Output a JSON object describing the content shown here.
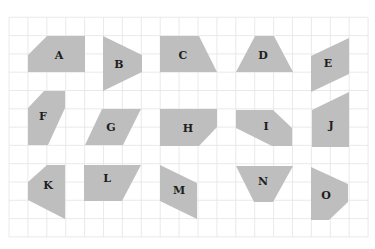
{
  "diagram": {
    "grid": {
      "x0": 9,
      "y0": 17.3,
      "columns": 19,
      "rows": 12,
      "cell_width": 18.9,
      "cell_height": 18.3,
      "line_color": "#e4e4e4"
    },
    "colors": {
      "shape_fill": "#bebebe",
      "label_color": "#1e1e1e",
      "background": "#ffffff"
    },
    "shapes": [
      {
        "label": "A",
        "points": [
          [
            47,
            36
          ],
          [
            85,
            36
          ],
          [
            85,
            72
          ],
          [
            28,
            72
          ],
          [
            28,
            55
          ]
        ],
        "label_pos": [
          59,
          55
        ]
      },
      {
        "label": "B",
        "points": [
          [
            103,
            36
          ],
          [
            142,
            55
          ],
          [
            142,
            72
          ],
          [
            103,
            91
          ]
        ],
        "label_pos": [
          119,
          64
        ]
      },
      {
        "label": "C",
        "points": [
          [
            160,
            36
          ],
          [
            199,
            36
          ],
          [
            217,
            72
          ],
          [
            160,
            72
          ]
        ],
        "label_pos": [
          183,
          55
        ]
      },
      {
        "label": "D",
        "points": [
          [
            255,
            36
          ],
          [
            274,
            36
          ],
          [
            293,
            72
          ],
          [
            236,
            72
          ]
        ],
        "label_pos": [
          263,
          55
        ]
      },
      {
        "label": "E",
        "points": [
          [
            311,
            56
          ],
          [
            349,
            38
          ],
          [
            349,
            74
          ],
          [
            311,
            92
          ]
        ],
        "label_pos": [
          328,
          63
        ]
      },
      {
        "label": "F",
        "points": [
          [
            44,
            91
          ],
          [
            65,
            91
          ],
          [
            65,
            108
          ],
          [
            48,
            145
          ],
          [
            28,
            145
          ],
          [
            28,
            108
          ]
        ],
        "label_pos": [
          43,
          116
        ]
      },
      {
        "label": "G",
        "points": [
          [
            102,
            109
          ],
          [
            141,
            109
          ],
          [
            123,
            145
          ],
          [
            85,
            145
          ]
        ],
        "label_pos": [
          111,
          127
        ]
      },
      {
        "label": "H",
        "points": [
          [
            160,
            109
          ],
          [
            217,
            109
          ],
          [
            217,
            127
          ],
          [
            199,
            146
          ],
          [
            160,
            146
          ]
        ],
        "label_pos": [
          188,
          128
        ]
      },
      {
        "label": "I",
        "points": [
          [
            236,
            110
          ],
          [
            273,
            110
          ],
          [
            292,
            128
          ],
          [
            292,
            146
          ],
          [
            272,
            146
          ],
          [
            236,
            128
          ]
        ],
        "label_pos": [
          266,
          126
        ]
      },
      {
        "label": "J",
        "points": [
          [
            312,
            110
          ],
          [
            349,
            92
          ],
          [
            349,
            147
          ],
          [
            312,
            147
          ]
        ],
        "label_pos": [
          331,
          125
        ]
      },
      {
        "label": "K",
        "points": [
          [
            47,
            165
          ],
          [
            65,
            165
          ],
          [
            65,
            219
          ],
          [
            28,
            200
          ],
          [
            28,
            182
          ]
        ],
        "label_pos": [
          48,
          185
        ]
      },
      {
        "label": "L",
        "points": [
          [
            84,
            165
          ],
          [
            141,
            165
          ],
          [
            122,
            201
          ],
          [
            84,
            201
          ]
        ],
        "label_pos": [
          107,
          178
        ]
      },
      {
        "label": "M",
        "points": [
          [
            160,
            165
          ],
          [
            197,
            183
          ],
          [
            197,
            219
          ],
          [
            160,
            201
          ]
        ],
        "label_pos": [
          179,
          190
        ]
      },
      {
        "label": "N",
        "points": [
          [
            236,
            166
          ],
          [
            293,
            166
          ],
          [
            273,
            202
          ],
          [
            254,
            202
          ]
        ],
        "label_pos": [
          263,
          181
        ]
      },
      {
        "label": "O",
        "points": [
          [
            311,
            167
          ],
          [
            348,
            184
          ],
          [
            348,
            202
          ],
          [
            329,
            220
          ],
          [
            311,
            220
          ]
        ],
        "label_pos": [
          326,
          195
        ]
      }
    ]
  }
}
